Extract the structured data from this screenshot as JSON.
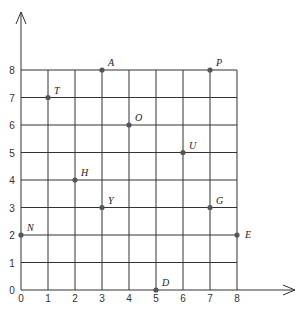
{
  "diagram": {
    "type": "coordinate-grid",
    "x_ticks": [
      "0",
      "1",
      "2",
      "3",
      "4",
      "5",
      "6",
      "7",
      "8"
    ],
    "y_ticks": [
      "0",
      "1",
      "2",
      "3",
      "4",
      "5",
      "6",
      "7",
      "8"
    ],
    "grid_color": "#333333",
    "point_color": "#555555",
    "points": [
      {
        "label": "A",
        "x": 3,
        "y": 8
      },
      {
        "label": "P",
        "x": 7,
        "y": 8
      },
      {
        "label": "T",
        "x": 1,
        "y": 7
      },
      {
        "label": "O",
        "x": 4,
        "y": 6
      },
      {
        "label": "U",
        "x": 6,
        "y": 5
      },
      {
        "label": "H",
        "x": 2,
        "y": 4
      },
      {
        "label": "Y",
        "x": 3,
        "y": 3
      },
      {
        "label": "G",
        "x": 7,
        "y": 3
      },
      {
        "label": "N",
        "x": 0,
        "y": 2
      },
      {
        "label": "E",
        "x": 8,
        "y": 2
      },
      {
        "label": "D",
        "x": 5,
        "y": 0
      }
    ]
  }
}
